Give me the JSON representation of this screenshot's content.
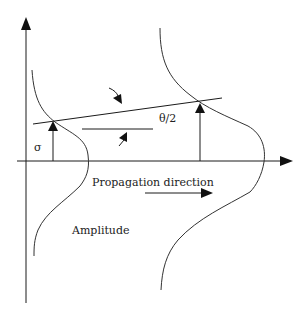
{
  "diagram": {
    "labels": {
      "sigma": "σ",
      "half_angle": "θ/2",
      "propagation": "Propagation direction",
      "amplitude": "Amplitude"
    },
    "colors": {
      "stroke": "#1a1a1a",
      "background": "#ffffff"
    },
    "elements": [
      "vertical-axis-with-up-arrow",
      "horizontal-axis-with-right-arrow",
      "left-amplitude-profile-curve",
      "right-amplitude-profile-curve",
      "left-sigma-arrow",
      "right-sigma-arrow",
      "tilted-wavefront-line",
      "reference-horizontal-line",
      "angle-indicator-arrows",
      "propagation-direction-arrow"
    ]
  }
}
